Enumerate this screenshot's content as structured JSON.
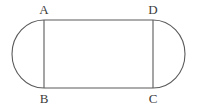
{
  "figure": {
    "shape_name": "stadium-outline",
    "stroke_color": "#5a5a5a",
    "label_color": "#3b3b3b",
    "background_color": "#ffffff",
    "geometry": {
      "top_edge_y": 20,
      "bottom_edge_y": 88,
      "rect_left_x": 44,
      "rect_right_x": 153,
      "arc_left_extreme_x": 12,
      "arc_right_extreme_x": 185,
      "rect_width": 109,
      "rect_height": 68,
      "arc_radius_x": 32,
      "arc_radius_y": 34
    },
    "labels": [
      {
        "text": "A",
        "x": 44,
        "y": 14,
        "vertex": "top-left"
      },
      {
        "text": "D",
        "x": 153,
        "y": 14,
        "vertex": "top-right"
      },
      {
        "text": "B",
        "x": 44,
        "y": 103,
        "vertex": "bottom-left"
      },
      {
        "text": "C",
        "x": 153,
        "y": 103,
        "vertex": "bottom-right"
      }
    ],
    "paths": {
      "outline": "M 44 20 L 153 20 A 32 34 0 0 1 153 88 L 44 88 A 32 34 0 0 1 44 20 Z",
      "chord_left": "M 44 20 L 44 88",
      "chord_right": "M 153 20 L 153 88"
    }
  }
}
